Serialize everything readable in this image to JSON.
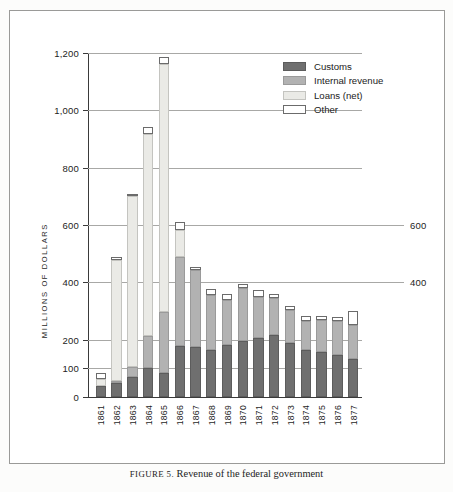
{
  "caption": {
    "prefix": "FIGURE 5.",
    "text": "Revenue of the federal government"
  },
  "chart_data": {
    "type": "bar",
    "stacked": true,
    "title": "Revenue of the federal government",
    "xlabel": "",
    "ylabel": "MILLIONS OF DOLLARS",
    "ylim": [
      0,
      1200
    ],
    "grid": true,
    "legend_position": "top-right",
    "y_ticks": [
      0,
      100,
      200,
      400,
      600,
      800,
      1000,
      1200
    ],
    "y_tick_labels": [
      "0",
      "100",
      "200",
      "400",
      "600",
      "800",
      "1,000",
      "1,200"
    ],
    "y_ticks_right": [
      400,
      600
    ],
    "y_tick_labels_right": [
      "400",
      "600"
    ],
    "categories": [
      "1861",
      "1862",
      "1863",
      "1864",
      "1865",
      "1866",
      "1867",
      "1868",
      "1869",
      "1870",
      "1871",
      "1872",
      "1873",
      "1874",
      "1875",
      "1876",
      "1877"
    ],
    "series": [
      {
        "name": "Customs",
        "color": "#6f6f6f",
        "values": [
          40,
          49,
          69,
          102,
          85,
          179,
          176,
          164,
          180,
          194,
          206,
          216,
          188,
          163,
          157,
          148,
          131
        ]
      },
      {
        "name": "Internal revenue",
        "color": "#b2b2b2",
        "values": [
          0,
          2,
          37,
          110,
          211,
          310,
          266,
          191,
          159,
          185,
          144,
          131,
          114,
          102,
          110,
          116,
          119
        ]
      },
      {
        "name": "Loans (net)",
        "color": "#eaeae6",
        "values": [
          23,
          421,
          595,
          706,
          864,
          92,
          0,
          0,
          0,
          0,
          0,
          0,
          0,
          0,
          0,
          0,
          0
        ]
      },
      {
        "name": "Other",
        "color": "#ffffff",
        "values": [
          21,
          12,
          8,
          25,
          25,
          31,
          13,
          21,
          22,
          15,
          22,
          12,
          16,
          18,
          15,
          15,
          49
        ]
      }
    ],
    "totals": [
      84,
      484,
      709,
      943,
      1185,
      612,
      455,
      376,
      361,
      394,
      372,
      359,
      318,
      283,
      282,
      279,
      299
    ]
  },
  "legend": {
    "items": [
      {
        "label": "Customs",
        "swatch": "customs-swatch"
      },
      {
        "label": "Internal revenue",
        "swatch": "internal-revenue-swatch"
      },
      {
        "label": "Loans (net)",
        "swatch": "loans-net-swatch"
      },
      {
        "label": "Other",
        "swatch": "other-swatch"
      }
    ]
  }
}
